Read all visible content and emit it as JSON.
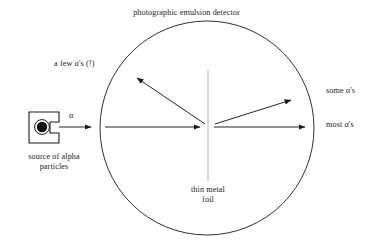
{
  "figure": {
    "title": "photographic emulsion detector",
    "background_color": "#ffffff",
    "stroke_color": "#1a1a1a",
    "foil_color": "#b0b0b0",
    "width": 373,
    "height": 245
  },
  "labels": {
    "detector": "photographic emulsion detector",
    "few_alphas": "a few α's (!)",
    "some_alphas": "some α's",
    "most_alphas": "most α's",
    "thin_metal_foil": "thin metal\nfoil",
    "thin_metal_foil_line1": "thin metal",
    "thin_metal_foil_line2": "foil",
    "source_line1": "source of alpha",
    "source_line2": "particles",
    "source_caption": "source of alpha particles",
    "alpha_beam": "α"
  },
  "geometry": {
    "detector_circle": {
      "cx": 207,
      "cy": 128,
      "r": 107
    },
    "foil_line": {
      "x": 208,
      "y1": 70,
      "y2": 181
    },
    "source_box": {
      "x": 29,
      "y": 112,
      "w": 30,
      "h": 31
    },
    "source_dot": {
      "cx": 42,
      "cy": 127,
      "r": 5.2
    },
    "source_ring": {
      "cx": 42,
      "cy": 127,
      "r": 7.4
    },
    "arrows": [
      {
        "name": "beam-from-source",
        "x1": 59,
        "y1": 127,
        "x2": 93,
        "y2": 127
      },
      {
        "name": "beam-to-foil",
        "x1": 105,
        "y1": 127,
        "x2": 202,
        "y2": 127
      },
      {
        "name": "most-alphas",
        "x1": 214,
        "y1": 127,
        "x2": 307,
        "y2": 127
      },
      {
        "name": "some-alphas",
        "x1": 215,
        "y1": 124,
        "x2": 293,
        "y2": 100
      },
      {
        "name": "few-alphas-backscatter",
        "x1": 205,
        "y1": 124,
        "x2": 135,
        "y2": 76
      }
    ]
  }
}
